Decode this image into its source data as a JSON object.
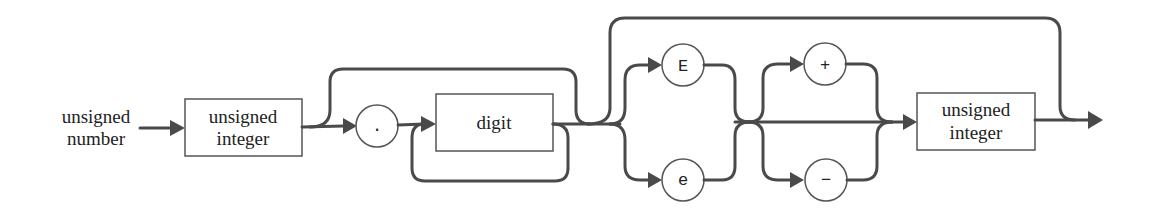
{
  "diagram": {
    "type": "syntax-diagram",
    "title": "unsigned number",
    "start_label": [
      "unsigned",
      "number"
    ],
    "nonterminals": [
      {
        "id": "unsigned-integer-1",
        "lines": [
          "unsigned",
          "integer"
        ]
      },
      {
        "id": "digit",
        "lines": [
          "digit"
        ]
      },
      {
        "id": "unsigned-integer-2",
        "lines": [
          "unsigned",
          "integer"
        ]
      }
    ],
    "terminals": [
      {
        "id": "dot",
        "symbol": "."
      },
      {
        "id": "E-upper",
        "symbol": "E"
      },
      {
        "id": "e-lower",
        "symbol": "e"
      },
      {
        "id": "plus",
        "symbol": "+"
      },
      {
        "id": "minus",
        "symbol": "−"
      }
    ],
    "colors": {
      "line": "#4a4a4a",
      "box_stroke": "#555555",
      "text": "#222222",
      "background": "#ffffff"
    }
  }
}
